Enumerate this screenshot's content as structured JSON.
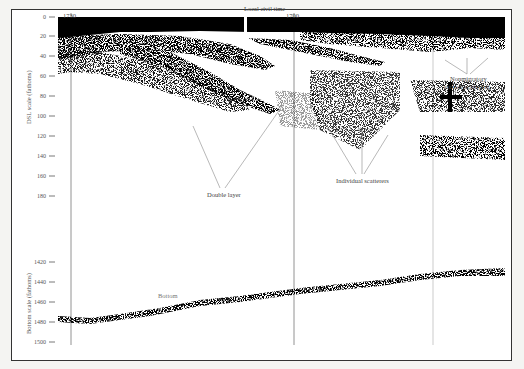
{
  "figure": {
    "top_label": "Local civil time",
    "time_marks": [
      {
        "label": "1730",
        "x": 71
      },
      {
        "label": "1700",
        "x": 294
      }
    ],
    "dsl_axis": {
      "title": "DSL scale (fathoms)",
      "ticks": [
        {
          "label": "0",
          "y": 17
        },
        {
          "label": "20",
          "y": 36
        },
        {
          "label": "40",
          "y": 56
        },
        {
          "label": "60",
          "y": 76
        },
        {
          "label": "80",
          "y": 96
        },
        {
          "label": "100",
          "y": 116
        },
        {
          "label": "120",
          "y": 136
        },
        {
          "label": "140",
          "y": 156
        },
        {
          "label": "160",
          "y": 176
        },
        {
          "label": "180",
          "y": 196
        }
      ]
    },
    "bottom_axis": {
      "title": "Bottom scale (fathoms)",
      "ticks": [
        {
          "label": "1420",
          "y": 262
        },
        {
          "label": "1440",
          "y": 282
        },
        {
          "label": "1460",
          "y": 302
        },
        {
          "label": "1480",
          "y": 322
        },
        {
          "label": "1500",
          "y": 342
        }
      ]
    },
    "annotations": {
      "double_layer": "Double layer",
      "individual_scatterers": "Individual scatterers",
      "nonmigratory_line1": "Nonmigratory",
      "nonmigratory_line2": "surface scattering",
      "bottom": "Bottom"
    },
    "colors": {
      "ink": "#000000",
      "paper": "#ffffff",
      "label": "#444444",
      "frame": "#333333"
    }
  }
}
